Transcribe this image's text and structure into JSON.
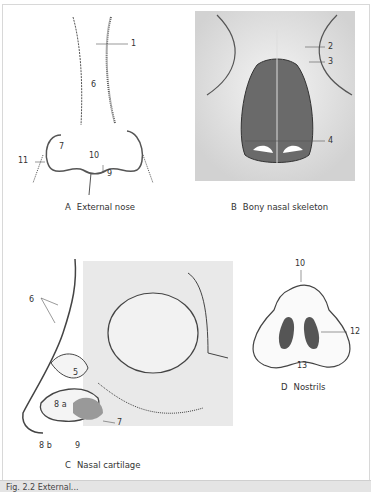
{
  "figure": {
    "panels": [
      {
        "letter": "A",
        "title": "External nose",
        "labels": [
          "1",
          "6",
          "7",
          "10",
          "11",
          "9"
        ]
      },
      {
        "letter": "B",
        "title": "Bony nasal skeleton",
        "labels": [
          "2",
          "3",
          "4"
        ]
      },
      {
        "letter": "C",
        "title": "Nasal cartilage",
        "labels": [
          "6",
          "5",
          "8 a",
          "7",
          "8 b",
          "9"
        ]
      },
      {
        "letter": "D",
        "title": "Nostrils",
        "labels": [
          "10",
          "12",
          "13"
        ]
      }
    ],
    "footer_caption": "Fig. 2.2 External..."
  },
  "colors": {
    "line": "#3a3a3a",
    "shade": "#bdbdbd",
    "footer_bg": "#e4e4e4",
    "bone_bg": "#e9e9e9"
  }
}
